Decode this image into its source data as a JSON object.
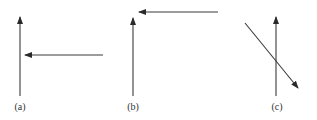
{
  "diagram": {
    "panels": [
      {
        "label": "(a)",
        "second_arrow": "horizontal, pointing left, toward the vertical arrow, at mid height"
      },
      {
        "label": "(b)",
        "second_arrow": "horizontal, pointing left, above and to the right of the vertical arrow's tip"
      },
      {
        "label": "(c)",
        "second_arrow": "diagonal, pointing down-right, crossing the vertical arrow"
      }
    ],
    "colors": {
      "stroke": "#3a3a3a",
      "background": "#ffffff"
    }
  }
}
